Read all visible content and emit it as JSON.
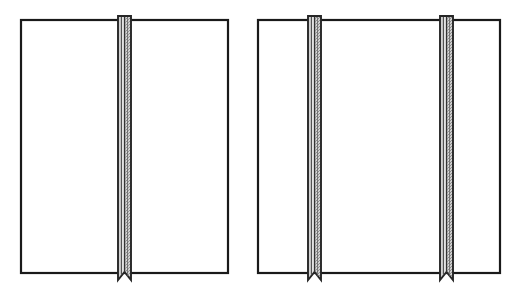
{
  "figure": {
    "type": "technical-line-drawing",
    "canvas": {
      "width": 520,
      "height": 293
    },
    "background_color": "#ffffff",
    "outline_color": "#1a1a1a",
    "band_edge_color": "#262626",
    "band_fill_light": "#d8d8d8",
    "band_fill_stipple": "#b9b9b9",
    "band_center_line_color": "#3a3a3a",
    "panels": [
      {
        "id": "panel-left",
        "label": "Left panel",
        "x": 21,
        "y": 20,
        "width": 207,
        "height": 253,
        "band_count": 1,
        "bands": [
          {
            "id": "band-left-1",
            "label": "Center pleat band",
            "x": 118,
            "width": 13,
            "top_overhang": 4,
            "bottom_overhang": 7,
            "notch_depth": 7
          }
        ]
      },
      {
        "id": "panel-right",
        "label": "Right panel",
        "x": 258,
        "y": 20,
        "width": 242,
        "height": 253,
        "band_count": 2,
        "bands": [
          {
            "id": "band-right-1",
            "label": "First pleat band",
            "x": 308,
            "width": 13,
            "top_overhang": 4,
            "bottom_overhang": 7,
            "notch_depth": 7
          },
          {
            "id": "band-right-2",
            "label": "Second pleat band",
            "x": 440,
            "width": 13,
            "top_overhang": 4,
            "bottom_overhang": 7,
            "notch_depth": 7
          }
        ]
      }
    ]
  }
}
